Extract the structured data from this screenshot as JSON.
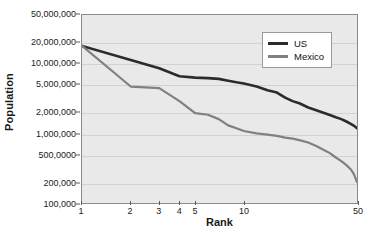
{
  "chart_data": {
    "type": "line",
    "title": "",
    "xlabel": "Rank",
    "ylabel": "Population",
    "xscale": "log",
    "yscale": "log",
    "xlim": [
      1,
      50
    ],
    "ylim": [
      100000,
      50000000
    ],
    "grid": true,
    "legend_position": "top-right",
    "x_ticks": [
      {
        "value": 1,
        "label": "1"
      },
      {
        "value": 2,
        "label": "2"
      },
      {
        "value": 3,
        "label": "3"
      },
      {
        "value": 4,
        "label": "4"
      },
      {
        "value": 5,
        "label": "5"
      },
      {
        "value": 10,
        "label": "10"
      },
      {
        "value": 50,
        "label": "50"
      }
    ],
    "y_ticks": [
      {
        "value": 50000000,
        "label": "50,000,000"
      },
      {
        "value": 20000000,
        "label": "20,000,000"
      },
      {
        "value": 10000000,
        "label": "10,000,000"
      },
      {
        "value": 5000000,
        "label": "5,000,000"
      },
      {
        "value": 2000000,
        "label": "2,000,000"
      },
      {
        "value": 1000000,
        "label": "1,000,000"
      },
      {
        "value": 500000,
        "label": "500,0000"
      },
      {
        "value": 200000,
        "label": "200,000"
      },
      {
        "value": 100000,
        "label": "100,000"
      }
    ],
    "series": [
      {
        "name": "US",
        "color": "#2b2b2b",
        "width": 2.6,
        "x": [
          1,
          2,
          3,
          4,
          5,
          6,
          7,
          8,
          9,
          10,
          12,
          14,
          16,
          18,
          20,
          22,
          25,
          28,
          31,
          34,
          37,
          40,
          43,
          46,
          48,
          50
        ],
        "y": [
          18000000,
          11300000,
          8600000,
          6600000,
          6300000,
          6200000,
          6050000,
          5700000,
          5400000,
          5200000,
          4700000,
          4150000,
          3850000,
          3250000,
          2900000,
          2700000,
          2350000,
          2150000,
          1980000,
          1830000,
          1700000,
          1600000,
          1480000,
          1360000,
          1280000,
          1180000
        ]
      },
      {
        "name": "Mexico",
        "color": "#808080",
        "width": 2.2,
        "x": [
          1,
          2,
          3,
          4,
          5,
          6,
          7,
          8,
          9,
          10,
          12,
          14,
          16,
          18,
          20,
          22,
          25,
          28,
          31,
          34,
          37,
          40,
          43,
          46,
          48,
          50
        ],
        "y": [
          18000000,
          4700000,
          4450000,
          2900000,
          1950000,
          1850000,
          1600000,
          1300000,
          1180000,
          1080000,
          1000000,
          960000,
          920000,
          870000,
          840000,
          800000,
          740000,
          660000,
          580000,
          520000,
          450000,
          400000,
          350000,
          300000,
          255000,
          200000
        ]
      }
    ]
  },
  "legend": {
    "items": [
      {
        "label": "US"
      },
      {
        "label": "Mexico"
      }
    ]
  },
  "axes": {
    "x_title": "Rank",
    "y_title": "Population"
  },
  "colors": {
    "us_line": "#2b2b2b",
    "mexico_line": "#808080",
    "plot_background": "#e9e9e9",
    "plot_border": "#8a8a8a",
    "gridline": "#d2d2d2",
    "page_background": "#ffffff",
    "text": "#1a1a1a"
  }
}
